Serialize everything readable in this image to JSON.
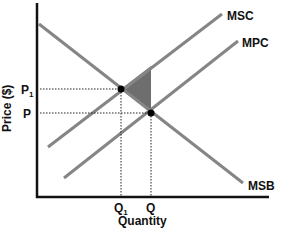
{
  "diagram": {
    "y_axis_label": "Price ($)",
    "x_axis_label": "Quantity",
    "curves": {
      "msc": "MSC",
      "mpc": "MPC",
      "msb": "MSB"
    },
    "price_ticks": {
      "p1": "P",
      "p1_sub": "1",
      "p": "P"
    },
    "quantity_ticks": {
      "q1": "Q",
      "q1_sub": "1",
      "q": "Q"
    },
    "colors": {
      "axis": "#111111",
      "curve": "#808080",
      "deadweight_triangle": "#6e6e6e",
      "dot": "#000000"
    }
  }
}
